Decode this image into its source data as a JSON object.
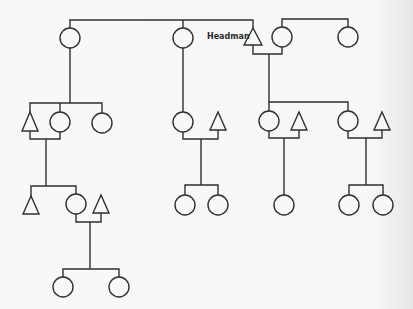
{
  "diagram": {
    "type": "kinship-chart",
    "legend": {
      "triangle": "male",
      "circle": "female"
    },
    "labels": {
      "headman": "Headman"
    },
    "colors": {
      "line": "#2f2f2f",
      "background": "#f7f7f5"
    },
    "nodes": [
      {
        "id": "g1_f1",
        "shape": "circle",
        "x": 70,
        "y": 38
      },
      {
        "id": "g1_f2",
        "shape": "circle",
        "x": 183,
        "y": 38
      },
      {
        "id": "g1_headman",
        "shape": "triangle",
        "x": 253,
        "y": 37,
        "label": "Headman"
      },
      {
        "id": "g1_f3",
        "shape": "circle",
        "x": 282,
        "y": 37
      },
      {
        "id": "g1_f4",
        "shape": "circle",
        "x": 348,
        "y": 37
      },
      {
        "id": "g2_m1",
        "shape": "triangle",
        "x": 30,
        "y": 122
      },
      {
        "id": "g2_f1",
        "shape": "circle",
        "x": 60,
        "y": 122
      },
      {
        "id": "g2_f2",
        "shape": "circle",
        "x": 102,
        "y": 123
      },
      {
        "id": "g2_f3",
        "shape": "circle",
        "x": 183,
        "y": 122
      },
      {
        "id": "g2_m2",
        "shape": "triangle",
        "x": 218,
        "y": 121
      },
      {
        "id": "g2_f4",
        "shape": "circle",
        "x": 269,
        "y": 121
      },
      {
        "id": "g2_m3",
        "shape": "triangle",
        "x": 299,
        "y": 121
      },
      {
        "id": "g2_f5",
        "shape": "circle",
        "x": 348,
        "y": 121
      },
      {
        "id": "g2_m4",
        "shape": "triangle",
        "x": 382,
        "y": 121
      },
      {
        "id": "g3_m1",
        "shape": "triangle",
        "x": 31,
        "y": 205
      },
      {
        "id": "g3_f1",
        "shape": "circle",
        "x": 76,
        "y": 204
      },
      {
        "id": "g3_m2",
        "shape": "triangle",
        "x": 101,
        "y": 204
      },
      {
        "id": "g3_f2",
        "shape": "circle",
        "x": 185,
        "y": 205
      },
      {
        "id": "g3_f3",
        "shape": "circle",
        "x": 218,
        "y": 205
      },
      {
        "id": "g3_f4",
        "shape": "circle",
        "x": 284,
        "y": 205
      },
      {
        "id": "g3_f5",
        "shape": "circle",
        "x": 349,
        "y": 205
      },
      {
        "id": "g3_f6",
        "shape": "circle",
        "x": 383,
        "y": 205
      },
      {
        "id": "g4_f1",
        "shape": "circle",
        "x": 63,
        "y": 287
      },
      {
        "id": "g4_f2",
        "shape": "circle",
        "x": 119,
        "y": 287
      }
    ]
  }
}
